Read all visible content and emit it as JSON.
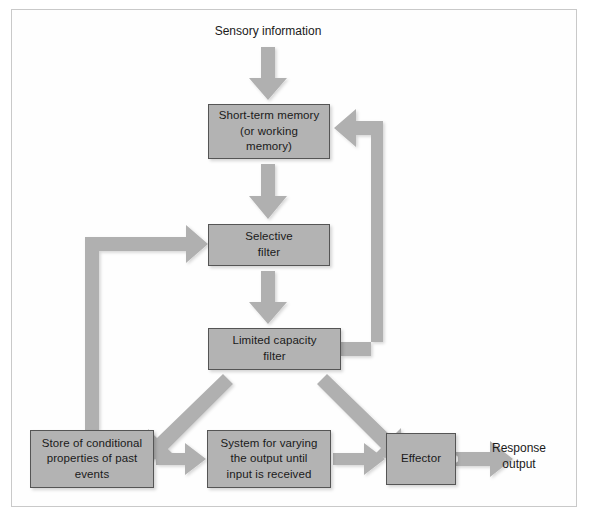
{
  "diagram": {
    "background_color": "#ffffff",
    "frame_color": "#c9c9c9",
    "node_fill": "#b3b3b3",
    "node_border": "#555555",
    "arrow_color": "#b0b0b0",
    "text_color": "#1a1a1a",
    "labels": {
      "sensory_information": "Sensory information",
      "response_output": "Response\noutput"
    },
    "nodes": [
      {
        "id": "stm",
        "label": "Short-term memory\n(or working\nmemory)"
      },
      {
        "id": "selfil",
        "label": "Selective\nfilter"
      },
      {
        "id": "limcap",
        "label": "Limited capacity\nfilter"
      },
      {
        "id": "store",
        "label": "Store of conditional\nproperties of past\nevents"
      },
      {
        "id": "system",
        "label": "System for varying\nthe output until\ninput is received"
      },
      {
        "id": "effector",
        "label": "Effector"
      }
    ],
    "edges": [
      {
        "from": "sensory_information",
        "to": "stm",
        "kind": "straight-down"
      },
      {
        "from": "stm",
        "to": "selfil",
        "kind": "straight-down"
      },
      {
        "from": "selfil",
        "to": "limcap",
        "kind": "straight-down"
      },
      {
        "from": "limcap",
        "to": "stm",
        "kind": "feedback-right-up"
      },
      {
        "from": "store",
        "to": "selfil",
        "kind": "feedback-left-up"
      },
      {
        "from": "limcap",
        "to": "store",
        "kind": "diagonal-down-left"
      },
      {
        "from": "limcap",
        "to": "effector",
        "kind": "diagonal-down-right"
      },
      {
        "from": "store",
        "to": "system",
        "kind": "straight-right"
      },
      {
        "from": "system",
        "to": "effector",
        "kind": "straight-right"
      },
      {
        "from": "effector",
        "to": "response_output",
        "kind": "straight-right"
      }
    ]
  }
}
